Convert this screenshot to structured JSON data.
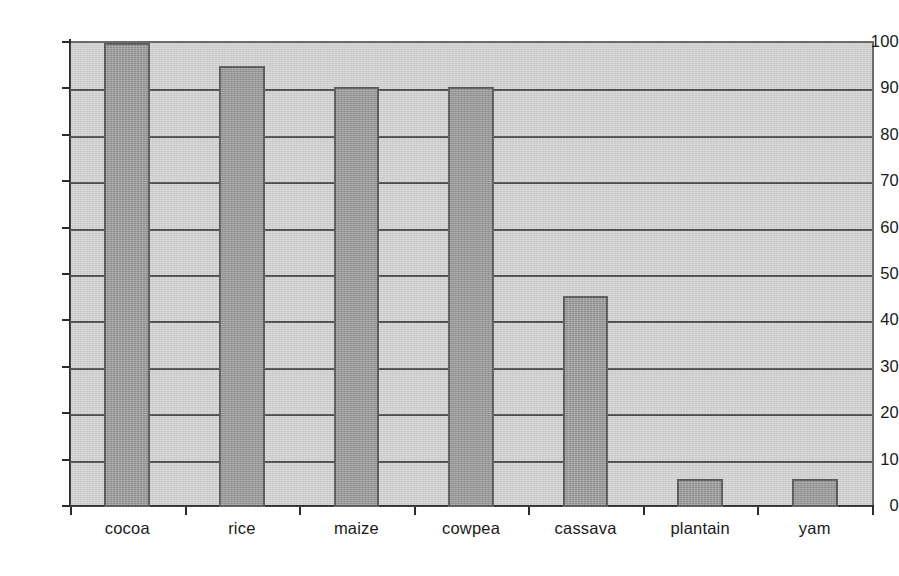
{
  "chart_data": {
    "type": "bar",
    "title": "",
    "subtitle": "",
    "xlabel": "",
    "ylabel": "",
    "categories": [
      "cocoa",
      "rice",
      "maize",
      "cowpea",
      "cassava",
      "plantain",
      "yam"
    ],
    "values": [
      100,
      95,
      90.5,
      90.5,
      45.5,
      6,
      6
    ],
    "series": [
      {
        "name": "",
        "values": [
          100,
          95,
          90.5,
          90.5,
          45.5,
          6,
          6
        ]
      }
    ],
    "ylim": [
      0,
      100
    ],
    "xlim_categories": 7,
    "y_ticks": [
      0,
      10,
      20,
      30,
      40,
      50,
      60,
      70,
      80,
      90,
      100
    ],
    "y_tick_labels": [
      "0",
      "10",
      "20",
      "30",
      "40",
      "50",
      "60",
      "70",
      "80",
      "90",
      "100"
    ],
    "grid": "horizontal",
    "gridlines_at": [
      10,
      20,
      30,
      40,
      50,
      60,
      70,
      80,
      90,
      100
    ],
    "legend": null,
    "legend_position": "none",
    "annotations": [],
    "colors": {
      "bar_fill": "#9c9c9c",
      "bar_edge": "#555555",
      "plot_background": "#d2d2d2",
      "figure_background": "#ffffff",
      "gridline": "#4a4a4a",
      "axis": "#2b2b2b",
      "tick_label": "#1a1a1a"
    }
  }
}
